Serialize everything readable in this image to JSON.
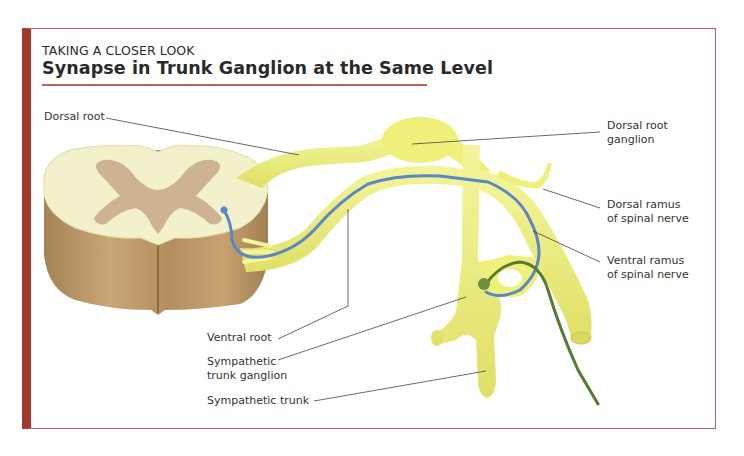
{
  "header": {
    "kicker": "TAKING A CLOSER LOOK",
    "title": "Synapse in Trunk Ganglion at the Same Level"
  },
  "colors": {
    "frame_border": "#a4382d",
    "title_rule": "#c0605a",
    "nerve_yellow": "#eef07a",
    "white_matter": "#f3f0cc",
    "gray_matter": "#cdb391",
    "cord_side": "#b99565",
    "preganglionic_blue": "#5b86c8",
    "postganglionic_green": "#557a36"
  },
  "labels": {
    "dorsal_root": "Dorsal root",
    "dorsal_root_ganglion_1": "Dorsal root",
    "dorsal_root_ganglion_2": "ganglion",
    "dorsal_ramus_1": "Dorsal ramus",
    "dorsal_ramus_2": "of spinal nerve",
    "ventral_ramus_1": "Ventral ramus",
    "ventral_ramus_2": "of spinal nerve",
    "ventral_root": "Ventral root",
    "sympathetic_trunk_ganglion_1": "Sympathetic",
    "sympathetic_trunk_ganglion_2": "trunk ganglion",
    "sympathetic_trunk": "Sympathetic trunk"
  }
}
